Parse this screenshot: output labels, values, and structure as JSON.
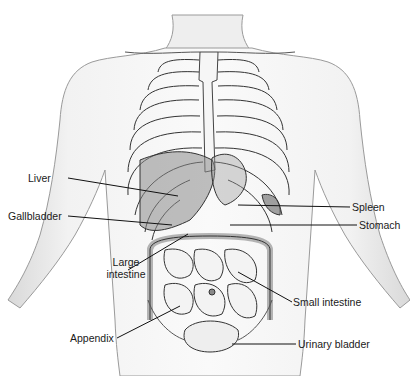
{
  "figure": {
    "labels": {
      "liver": "Liver",
      "gallbladder": "Gallbladder",
      "large_intestine_line1": "Large",
      "large_intestine_line2": "intestine",
      "appendix": "Appendix",
      "spleen": "Spleen",
      "stomach": "Stomach",
      "small_intestine": "Small intestine",
      "urinary_bladder": "Urinary bladder"
    }
  }
}
